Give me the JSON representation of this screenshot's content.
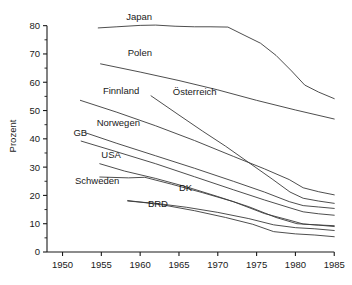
{
  "chart_data": {
    "type": "line",
    "title": "",
    "xlabel": "",
    "ylabel": "Prozent",
    "xlim": [
      1948,
      1986
    ],
    "ylim": [
      0,
      82
    ],
    "grid": false,
    "legend": "inline-labels",
    "x_ticks": [
      "1950",
      "1955",
      "1960",
      "1965",
      "1970",
      "1975",
      "1980",
      "1985"
    ],
    "x_tick_values": [
      1950,
      1955,
      1960,
      1965,
      1970,
      1975,
      1980,
      1985
    ],
    "y_ticks": [
      "0",
      "10",
      "20",
      "30",
      "40",
      "50",
      "60",
      "70",
      "80"
    ],
    "y_tick_values": [
      0,
      10,
      20,
      30,
      40,
      50,
      60,
      70,
      80
    ],
    "y_minor_tick_values": [
      5,
      15,
      25,
      35,
      45,
      55,
      65,
      75
    ],
    "series": [
      {
        "name": "Japan",
        "label": "Japan",
        "label_x": 1958.2,
        "label_y": 82.0,
        "points": [
          [
            1954.6,
            79.2
          ],
          [
            1957.0,
            79.6
          ],
          [
            1960.0,
            80.1
          ],
          [
            1962.0,
            80.2
          ],
          [
            1964.5,
            79.8
          ],
          [
            1967.0,
            79.6
          ],
          [
            1969.0,
            79.6
          ],
          [
            1971.3,
            79.5
          ],
          [
            1973.5,
            76.5
          ],
          [
            1975.5,
            73.8
          ],
          [
            1977.5,
            69.5
          ],
          [
            1979.5,
            64.0
          ],
          [
            1981.2,
            59.0
          ],
          [
            1983.0,
            56.5
          ],
          [
            1985.0,
            54.2
          ]
        ]
      },
      {
        "name": "Polen",
        "label": "Polen",
        "label_x": 1958.4,
        "label_y": 69.2,
        "points": [
          [
            1954.9,
            66.5
          ],
          [
            1960.0,
            63.6
          ],
          [
            1965.0,
            60.6
          ],
          [
            1970.0,
            57.3
          ],
          [
            1975.0,
            53.6
          ],
          [
            1980.0,
            50.2
          ],
          [
            1985.0,
            47.0
          ]
        ]
      },
      {
        "name": "Finnland",
        "label": "Finnland",
        "label_x": 1955.2,
        "label_y": 56.0,
        "points": [
          [
            1952.3,
            53.6
          ],
          [
            1957.0,
            49.4
          ],
          [
            1962.0,
            44.6
          ],
          [
            1967.0,
            39.4
          ],
          [
            1972.0,
            33.8
          ],
          [
            1976.0,
            29.4
          ],
          [
            1979.2,
            25.6
          ],
          [
            1981.0,
            22.7
          ],
          [
            1983.0,
            21.3
          ],
          [
            1985.0,
            20.2
          ]
        ]
      },
      {
        "name": "Österreich",
        "label": "Österreich",
        "label_x": 1964.2,
        "label_y": 55.6,
        "points": [
          [
            1961.4,
            55.2
          ],
          [
            1965.0,
            48.4
          ],
          [
            1968.0,
            42.8
          ],
          [
            1971.0,
            37.4
          ],
          [
            1974.0,
            31.6
          ],
          [
            1977.0,
            25.8
          ],
          [
            1979.3,
            21.2
          ],
          [
            1981.0,
            19.0
          ],
          [
            1983.0,
            18.0
          ],
          [
            1985.0,
            17.2
          ]
        ]
      },
      {
        "name": "Norwegen",
        "label": "Norwegen",
        "label_x": 1954.4,
        "label_y": 44.4,
        "points": [
          [
            1952.9,
            42.2
          ],
          [
            1957.0,
            38.4
          ],
          [
            1962.0,
            34.0
          ],
          [
            1967.0,
            29.6
          ],
          [
            1972.0,
            25.0
          ],
          [
            1976.0,
            21.2
          ],
          [
            1979.2,
            17.8
          ],
          [
            1981.0,
            16.4
          ],
          [
            1983.0,
            15.9
          ],
          [
            1985.0,
            15.4
          ]
        ]
      },
      {
        "name": "GB",
        "label": "GB",
        "label_x": 1951.4,
        "label_y": 41.0,
        "points": [
          [
            1952.4,
            39.2
          ],
          [
            1957.0,
            35.4
          ],
          [
            1962.0,
            31.2
          ],
          [
            1967.0,
            26.6
          ],
          [
            1972.0,
            22.0
          ],
          [
            1976.0,
            18.4
          ],
          [
            1979.3,
            15.6
          ],
          [
            1981.0,
            14.2
          ],
          [
            1983.0,
            13.5
          ],
          [
            1985.0,
            13.0
          ]
        ]
      },
      {
        "name": "USA",
        "label": "USA",
        "label_x": 1955.0,
        "label_y": 33.2,
        "points": [
          [
            1954.8,
            31.2
          ],
          [
            1958.0,
            28.6
          ],
          [
            1962.0,
            26.0
          ],
          [
            1966.0,
            23.0
          ],
          [
            1970.0,
            19.6
          ],
          [
            1974.0,
            16.0
          ],
          [
            1977.5,
            12.2
          ],
          [
            1980.2,
            10.0
          ],
          [
            1982.5,
            9.6
          ],
          [
            1985.0,
            9.3
          ]
        ]
      },
      {
        "name": "Schweden",
        "label": "Schweden",
        "label_x": 1951.6,
        "label_y": 24.0,
        "points": [
          [
            1954.8,
            26.5
          ],
          [
            1958.5,
            26.2
          ],
          [
            1960.6,
            26.4
          ],
          [
            1964.0,
            24.0
          ],
          [
            1968.0,
            21.0
          ],
          [
            1972.0,
            17.8
          ],
          [
            1976.0,
            13.6
          ],
          [
            1979.3,
            11.2
          ],
          [
            1981.0,
            9.9
          ],
          [
            1983.0,
            9.5
          ],
          [
            1985.0,
            9.0
          ]
        ]
      },
      {
        "name": "DK",
        "label": "DK",
        "label_x": 1965.0,
        "label_y": 21.6,
        "points": [
          [
            1958.4,
            18.0
          ],
          [
            1962.0,
            17.2
          ],
          [
            1966.0,
            15.8
          ],
          [
            1970.0,
            14.0
          ],
          [
            1974.0,
            11.8
          ],
          [
            1977.2,
            9.6
          ],
          [
            1980.0,
            8.6
          ],
          [
            1982.5,
            8.2
          ],
          [
            1985.0,
            7.6
          ]
        ]
      },
      {
        "name": "BRD",
        "label": "BRD",
        "label_x": 1961.0,
        "label_y": 16.0,
        "points": [
          [
            1958.4,
            18.2
          ],
          [
            1963.0,
            16.6
          ],
          [
            1967.0,
            14.6
          ],
          [
            1971.0,
            12.2
          ],
          [
            1974.5,
            9.8
          ],
          [
            1977.2,
            7.2
          ],
          [
            1980.0,
            6.4
          ],
          [
            1982.5,
            6.0
          ],
          [
            1985.0,
            5.4
          ]
        ]
      }
    ]
  }
}
